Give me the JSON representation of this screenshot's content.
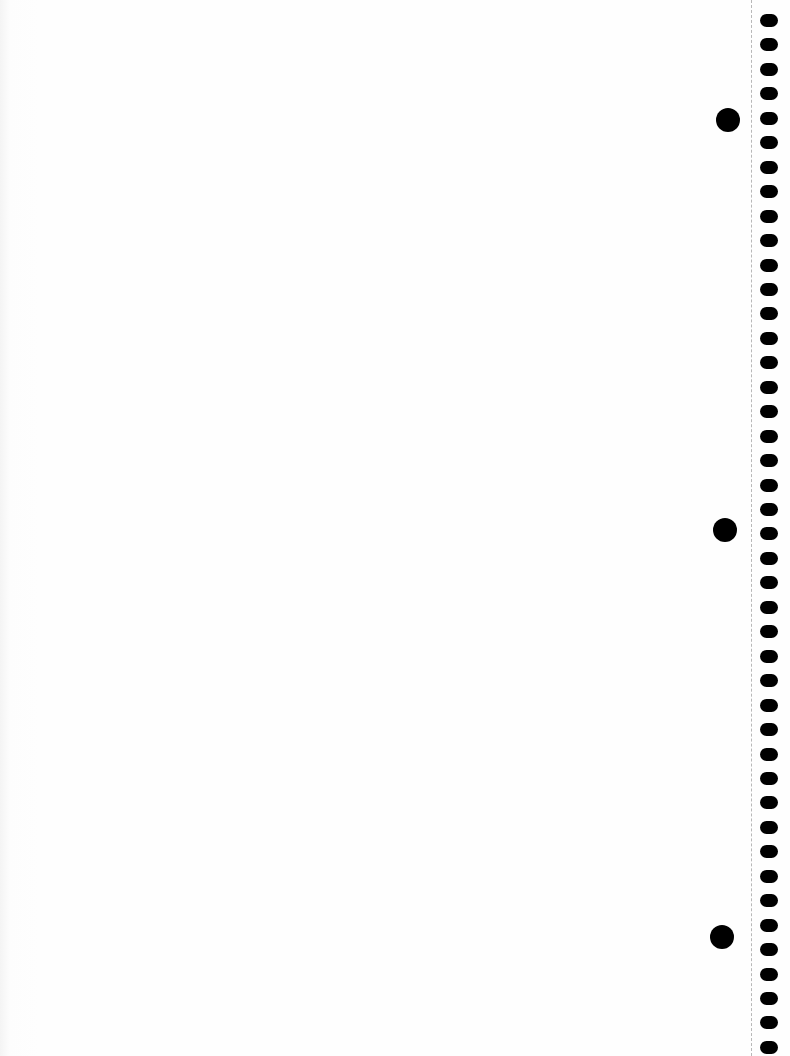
{
  "page": {
    "type": "spiral notebook sheet",
    "content": "",
    "background_color": "#fefefe"
  },
  "perforation": {
    "x": 751,
    "color": "#b8b8b8"
  },
  "spiral": {
    "x": 760,
    "start_y": 14,
    "spacing": 24.45,
    "count": 43,
    "color": "#000000"
  },
  "binder_holes": [
    {
      "cx": 728,
      "cy": 120
    },
    {
      "cx": 725,
      "cy": 530
    },
    {
      "cx": 722,
      "cy": 937
    }
  ]
}
